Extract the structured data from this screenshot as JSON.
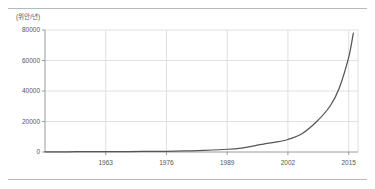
{
  "figure": {
    "unit_label": "(위안/년)",
    "colors": {
      "line": "#555555",
      "grid": "#d8d8d8",
      "axis": "#9a9a9a",
      "rule": "#b9b9b9",
      "text": "#555555",
      "background": "#ffffff"
    }
  },
  "chart_data": {
    "type": "line",
    "title": "",
    "subtitle": "",
    "xlabel": "",
    "ylabel": "(위안/년)",
    "grid": true,
    "legend": false,
    "legend_position": "none",
    "xlim": [
      1950,
      2017
    ],
    "ylim": [
      0,
      80000
    ],
    "xticks": [
      1963,
      1976,
      1989,
      2002,
      2015
    ],
    "xtick_labels": [
      "1963",
      "1976",
      "1989",
      "2002",
      "2015"
    ],
    "yticks": [
      0,
      20000,
      40000,
      60000,
      80000
    ],
    "ytick_labels": [
      "0",
      "20000",
      "40000",
      "60000",
      "80000"
    ],
    "series": [
      {
        "name": "연간 소득",
        "x": [
          1950,
          1955,
          1960,
          1963,
          1968,
          1972,
          1976,
          1980,
          1984,
          1989,
          1992,
          1995,
          1997,
          2000,
          2002,
          2005,
          2008,
          2011,
          2013,
          2015,
          2016
        ],
        "values": [
          120,
          160,
          200,
          240,
          300,
          380,
          480,
          700,
          1100,
          1800,
          2600,
          4200,
          5400,
          6800,
          8200,
          12000,
          19500,
          30000,
          42000,
          62000,
          78000
        ]
      }
    ]
  }
}
